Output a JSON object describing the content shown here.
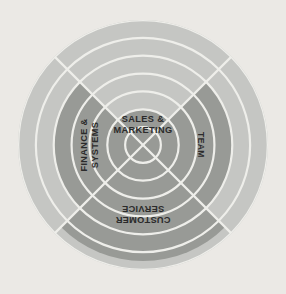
{
  "chart_data": {
    "type": "pie",
    "subtype": "radial-quadrant-wheel",
    "rings": 7,
    "ring_scale_max": 7,
    "ring_scale_min": 0,
    "grid": true,
    "legend": "none",
    "categories": [
      "SALES & MARKETING",
      "TEAM",
      "CUSTOMER SERVICE",
      "FINANCE & SYSTEMS"
    ],
    "values": [
      2,
      5,
      6.5,
      5
    ],
    "segments": [
      {
        "label": "SALES & MARKETING",
        "value": 2,
        "start_angle_deg": -45,
        "end_angle_deg": 45,
        "label_rotation_deg": 0,
        "label_lines": [
          "SALES &",
          "MARKETING"
        ]
      },
      {
        "label": "TEAM",
        "value": 5,
        "start_angle_deg": 45,
        "end_angle_deg": 135,
        "label_rotation_deg": 90,
        "label_lines": [
          "TEAM"
        ]
      },
      {
        "label": "CUSTOMER SERVICE",
        "value": 6.5,
        "start_angle_deg": 135,
        "end_angle_deg": 225,
        "label_rotation_deg": 180,
        "label_lines": [
          "CUSTOMER",
          "SERVICE"
        ]
      },
      {
        "label": "FINANCE & SYSTEMS",
        "value": 5,
        "start_angle_deg": 225,
        "end_angle_deg": 315,
        "label_rotation_deg": 270,
        "label_lines": [
          "FINANCE &",
          "SYSTEMS"
        ]
      }
    ],
    "xlabel": "",
    "ylabel": "",
    "colors": {
      "background": "#ebe9e5",
      "ring_band": "#c5c6c3",
      "data_fill": "#989a96",
      "gridline": "#eeeeea",
      "label_text": "#2b2b2b",
      "divider": "#eeeeea"
    },
    "geometry": {
      "center_x": 143,
      "center_y": 145,
      "outer_radius": 125
    }
  }
}
